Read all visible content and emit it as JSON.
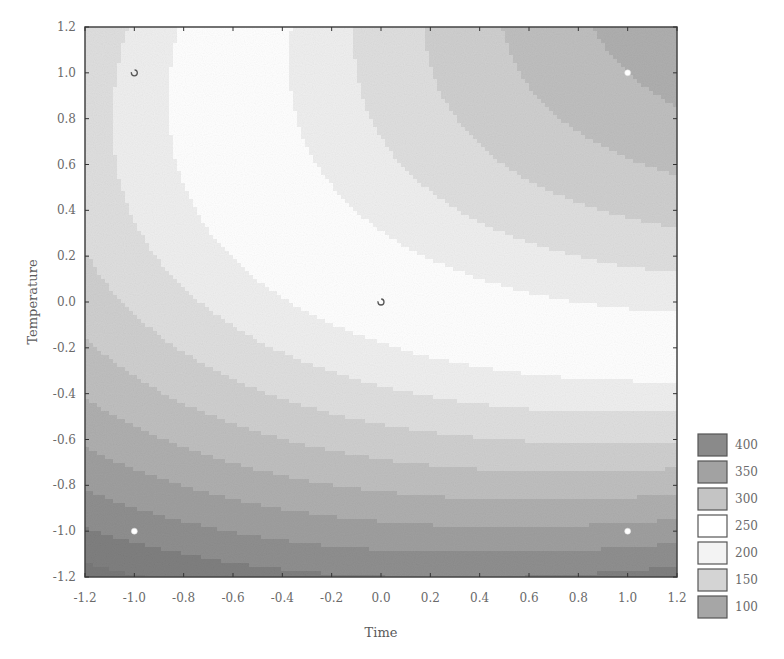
{
  "chart_data": {
    "type": "heatmap",
    "subtype": "contour",
    "title": "",
    "xlabel": "Time",
    "ylabel": "Temperature",
    "xlim": [
      -1.2,
      1.2
    ],
    "ylim": [
      -1.2,
      1.2
    ],
    "x_ticks": [
      "-1.2",
      "-1.0",
      "-0.8",
      "-0.6",
      "-0.4",
      "-0.2",
      "0.0",
      "0.2",
      "0.4",
      "0.6",
      "0.8",
      "1.0",
      "1.2"
    ],
    "y_ticks": [
      "1.2",
      "1.0",
      "0.8",
      "0.6",
      "0.4",
      "0.2",
      "0.0",
      "-0.2",
      "-0.4",
      "-0.6",
      "-0.8",
      "-1.0",
      "-1.2"
    ],
    "grid": false,
    "legend_position": "right-bottom",
    "legend": [
      {
        "label": "400",
        "color": "#8a8a8a"
      },
      {
        "label": "350",
        "color": "#a2a2a2"
      },
      {
        "label": "300",
        "color": "#c4c4c4"
      },
      {
        "label": "250",
        "color": "#ffffff"
      },
      {
        "label": "200",
        "color": "#f3f3f3"
      },
      {
        "label": "150",
        "color": "#d4d4d4"
      },
      {
        "label": "100",
        "color": "#a6a6a6"
      }
    ],
    "levels": [
      100,
      150,
      200,
      250,
      300,
      350,
      400
    ],
    "surface_model": {
      "description": "approximate quadratic response surface z = b0 + b1*x + b2*y + b12*x*y + b11*x^2 + b22*y^2",
      "b0": 250,
      "b1": 60,
      "b2": 130,
      "b12": 40,
      "b11": -20,
      "b22": -55
    },
    "design_points": [
      {
        "x": -1.0,
        "y": 1.0,
        "marker": "open"
      },
      {
        "x": 1.0,
        "y": 1.0,
        "marker": "filled-white"
      },
      {
        "x": 0.0,
        "y": 0.0,
        "marker": "open"
      },
      {
        "x": -1.0,
        "y": -1.0,
        "marker": "filled-white"
      },
      {
        "x": 1.0,
        "y": -1.0,
        "marker": "filled-white"
      }
    ]
  }
}
